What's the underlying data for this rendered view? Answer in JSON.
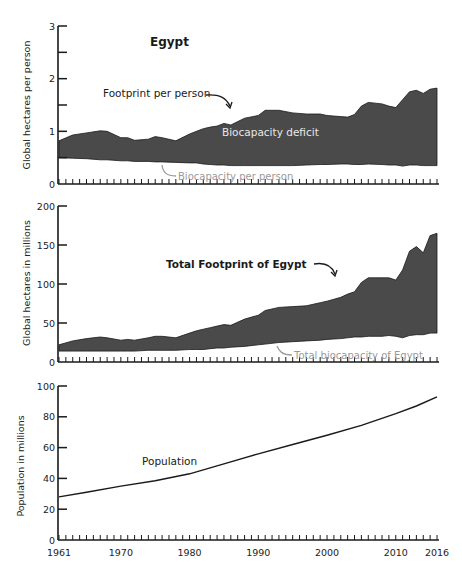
{
  "chart_data": [
    {
      "type": "area",
      "title": "Egypt",
      "xlabel": "",
      "ylabel": "Global hectares per person",
      "ylim": [
        0,
        3
      ],
      "yticks": [
        0,
        1,
        2,
        3
      ],
      "xlim": [
        1961,
        2016
      ],
      "grid": false,
      "legend": "none (inline annotations)",
      "x": [
        1961,
        1963,
        1965,
        1967,
        1968,
        1970,
        1971,
        1972,
        1974,
        1975,
        1976,
        1978,
        1980,
        1981,
        1982,
        1983,
        1984,
        1985,
        1986,
        1988,
        1990,
        1991,
        1993,
        1995,
        1997,
        1999,
        2000,
        2002,
        2003,
        2004,
        2005,
        2006,
        2008,
        2009,
        2010,
        2011,
        2012,
        2013,
        2014,
        2015,
        2016
      ],
      "series": [
        {
          "name": "Footprint per person",
          "values": [
            0.82,
            0.93,
            0.97,
            1.01,
            1.0,
            0.88,
            0.88,
            0.83,
            0.85,
            0.9,
            0.88,
            0.82,
            0.95,
            1.0,
            1.05,
            1.08,
            1.1,
            1.15,
            1.12,
            1.25,
            1.3,
            1.4,
            1.4,
            1.35,
            1.33,
            1.33,
            1.3,
            1.28,
            1.27,
            1.32,
            1.48,
            1.55,
            1.52,
            1.48,
            1.45,
            1.6,
            1.75,
            1.78,
            1.72,
            1.8,
            1.82
          ]
        },
        {
          "name": "Biocapacity per person",
          "values": [
            0.5,
            0.49,
            0.48,
            0.46,
            0.46,
            0.44,
            0.44,
            0.43,
            0.43,
            0.42,
            0.42,
            0.41,
            0.4,
            0.4,
            0.38,
            0.37,
            0.36,
            0.36,
            0.35,
            0.35,
            0.35,
            0.35,
            0.35,
            0.35,
            0.36,
            0.37,
            0.37,
            0.38,
            0.38,
            0.37,
            0.37,
            0.38,
            0.37,
            0.36,
            0.36,
            0.34,
            0.36,
            0.36,
            0.35,
            0.35,
            0.35
          ]
        }
      ],
      "annotations": [
        "Footprint per person",
        "Biocapacity deficit",
        "Biocapacity per person"
      ]
    },
    {
      "type": "area",
      "title": "",
      "xlabel": "",
      "ylabel": "Global hectares in millions",
      "ylim": [
        0,
        200
      ],
      "yticks": [
        0,
        50,
        100,
        150,
        200
      ],
      "xlim": [
        1961,
        2016
      ],
      "grid": false,
      "x": [
        1961,
        1963,
        1965,
        1967,
        1968,
        1970,
        1971,
        1972,
        1974,
        1975,
        1976,
        1978,
        1980,
        1981,
        1982,
        1983,
        1984,
        1985,
        1986,
        1988,
        1990,
        1991,
        1993,
        1995,
        1997,
        1999,
        2000,
        2002,
        2003,
        2004,
        2005,
        2006,
        2008,
        2009,
        2010,
        2011,
        2012,
        2013,
        2014,
        2015,
        2016
      ],
      "series": [
        {
          "name": "Total Footprint of Egypt",
          "values": [
            22,
            27,
            30,
            32,
            31,
            28,
            29,
            28,
            31,
            33,
            33,
            31,
            37,
            40,
            42,
            44,
            46,
            48,
            47,
            55,
            60,
            66,
            70,
            71,
            72,
            76,
            78,
            83,
            87,
            90,
            102,
            108,
            108,
            108,
            105,
            118,
            142,
            148,
            140,
            162,
            165
          ]
        },
        {
          "name": "Total biocapacity of Egypt",
          "values": [
            14,
            14,
            14,
            14,
            14,
            14,
            14,
            14,
            15,
            15,
            15,
            15,
            16,
            16,
            16,
            17,
            18,
            18,
            19,
            20,
            22,
            23,
            25,
            26,
            27,
            28,
            29,
            30,
            31,
            32,
            32,
            33,
            33,
            34,
            33,
            31,
            34,
            35,
            35,
            37,
            37
          ]
        }
      ],
      "annotations": [
        "Total Footprint of Egypt",
        "Total biocapacity of Egypt"
      ]
    },
    {
      "type": "line",
      "title": "",
      "xlabel": "",
      "ylabel": "Population in millions",
      "ylim": [
        0,
        100
      ],
      "yticks": [
        0,
        20,
        40,
        60,
        80,
        100
      ],
      "xticks": [
        1961,
        1970,
        1980,
        1990,
        2000,
        2010,
        2016
      ],
      "xlim": [
        1961,
        2016
      ],
      "grid": false,
      "x": [
        1961,
        1965,
        1970,
        1975,
        1980,
        1985,
        1990,
        1995,
        2000,
        2005,
        2010,
        2013,
        2016
      ],
      "series": [
        {
          "name": "Population",
          "values": [
            28,
            31,
            35,
            38.5,
            43,
            49.5,
            56,
            62,
            68,
            74.5,
            82,
            87,
            93
          ]
        }
      ],
      "annotations": [
        "Population"
      ]
    }
  ],
  "labels": {
    "title": "Egypt",
    "footprint_per_person": "Footprint per person",
    "biocapacity_deficit": "Biocapacity deficit",
    "biocapacity_per_person": "Biocapacity per person",
    "total_footprint": "Total Footprint of Egypt",
    "total_biocapacity": "Total biocapacity of Egypt",
    "population": "Population",
    "ylabel_top": "Global hectares per person",
    "ylabel_mid": "Global hectares in millions",
    "ylabel_bottom": "Population in millions"
  },
  "colors": {
    "area_fill": "#4a4a4a",
    "axis": "#1a1a1a",
    "grey_label": "#9a9a9a",
    "white_label": "#e8e8e8"
  }
}
